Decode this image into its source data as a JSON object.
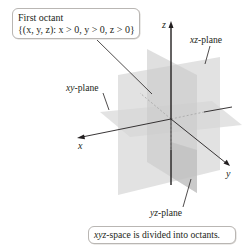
{
  "figure": {
    "caption": {
      "italic_part": "xyz",
      "rest": "-space is divided into octants."
    },
    "first_octant_callout": {
      "title": "First octant",
      "definition": "{(x, y, z): x > 0, y > 0, z > 0}"
    },
    "plane_labels": {
      "xz": {
        "italic": "xz",
        "suffix": "-plane"
      },
      "xy": {
        "italic": "xy",
        "suffix": "-plane"
      },
      "yz": {
        "italic": "yz",
        "suffix": "-plane"
      }
    },
    "axes": {
      "x": "x",
      "y": "y",
      "z": "z"
    },
    "colors": {
      "plane_fill": "#d9d9d9",
      "plane_fill_dark": "#c4c4c4",
      "axis": "#231f20",
      "leader": "#231f20",
      "hidden_axis_dash": "#a9a9a9",
      "callout_border": "#b9b6b3",
      "background": "#ffffff"
    }
  }
}
